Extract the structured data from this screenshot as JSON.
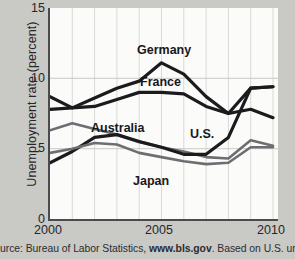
{
  "chart_data": {
    "type": "line",
    "title": "",
    "xlabel": "",
    "ylabel": "Unemployment rate (percent)",
    "xlim": [
      2000,
      2010
    ],
    "ylim": [
      0,
      15
    ],
    "yticks": [
      15,
      10,
      5,
      0
    ],
    "xticks": [
      2000,
      2005,
      2010
    ],
    "x": [
      2000,
      2001,
      2002,
      2003,
      2004,
      2005,
      2006,
      2007,
      2008,
      2009,
      2010
    ],
    "grid": "vertical-and-horizontal-light",
    "legend": "inline-annotations",
    "series": [
      {
        "name": "Germany",
        "color": "#1b1b1e",
        "values": [
          7.8,
          7.9,
          8.6,
          9.3,
          9.8,
          11.1,
          10.3,
          8.7,
          7.5,
          7.8,
          7.2
        ]
      },
      {
        "name": "France",
        "color": "#1b1b1e",
        "values": [
          8.7,
          7.9,
          8.0,
          8.5,
          9.0,
          9.0,
          8.9,
          8.0,
          7.5,
          9.3,
          9.4
        ]
      },
      {
        "name": "Australia",
        "color": "#6e6e72",
        "values": [
          6.3,
          6.8,
          6.4,
          6.0,
          5.5,
          5.1,
          4.8,
          4.4,
          4.3,
          5.6,
          5.2
        ]
      },
      {
        "name": "U.S.",
        "color": "#1b1b1e",
        "values": [
          4.0,
          4.8,
          5.8,
          6.0,
          5.5,
          5.1,
          4.6,
          4.6,
          5.8,
          9.3,
          9.4
        ]
      },
      {
        "name": "Japan",
        "color": "#6e6e72",
        "values": [
          4.7,
          5.0,
          5.4,
          5.3,
          4.7,
          4.4,
          4.1,
          3.9,
          4.0,
          5.1,
          5.1
        ]
      }
    ],
    "annotations": [
      {
        "text": "Germany",
        "x_px": 137,
        "y_px": 44
      },
      {
        "text": "France",
        "x_px": 140,
        "y_px": 76
      },
      {
        "text": "Australia",
        "x_px": 91,
        "y_px": 122
      },
      {
        "text": "U.S.",
        "x_px": 190,
        "y_px": 128
      },
      {
        "text": "Japan",
        "x_px": 133,
        "y_px": 175
      }
    ]
  },
  "axes": {
    "y_title": "Unemployment rate (percent)",
    "y_ticks": [
      "15",
      "10",
      "5",
      "0"
    ],
    "x_ticks": [
      "2000",
      "2005",
      "2010"
    ]
  },
  "caption": {
    "lead": "urce: Bureau of Labor Statistics, ",
    "bold": "www.bls.gov",
    "tail": ". Based on U.S. unemployment"
  },
  "colors": {
    "background": "#c9c9c6",
    "plot_background": "#fbfbfa",
    "axis": "#4b4b4f",
    "gridline": "#d6d6d4",
    "dark_series": "#1b1b1e",
    "gray_series": "#6e6e72",
    "text": "#26262a"
  }
}
